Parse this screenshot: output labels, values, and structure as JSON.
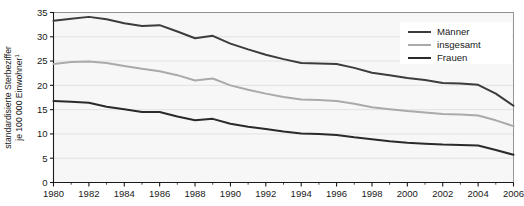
{
  "chart_data": {
    "type": "line",
    "title": "",
    "subtitle": "",
    "xlabel": "",
    "ylabel": "standardisierte Sterbeziffer je 100 000 Einwohner",
    "ylabel_superscript": "1",
    "xlim": [
      1980,
      2006
    ],
    "ylim": [
      0,
      35
    ],
    "y_ticks": [
      0,
      5,
      10,
      15,
      20,
      25,
      30,
      35
    ],
    "y_tick_labels": [
      "0",
      "5",
      "10",
      "15",
      "20",
      "25",
      "30",
      "35"
    ],
    "x_ticks": [
      1980,
      1982,
      1984,
      1986,
      1988,
      1990,
      1992,
      1994,
      1996,
      1998,
      2000,
      2002,
      2004,
      2006
    ],
    "x_tick_labels": [
      "1980",
      "1982",
      "1984",
      "1986",
      "1988",
      "1990",
      "1992",
      "1994",
      "1996",
      "1998",
      "2000",
      "2002",
      "2004",
      "2006"
    ],
    "x_minor_ticks": [
      1981,
      1983,
      1985,
      1987,
      1989,
      1991,
      1993,
      1995,
      1997,
      1999,
      2001,
      2003,
      2005
    ],
    "grid": "horizontal",
    "legend_position": "top-right",
    "x": [
      1980,
      1981,
      1982,
      1983,
      1984,
      1985,
      1986,
      1987,
      1988,
      1989,
      1990,
      1991,
      1992,
      1993,
      1994,
      1995,
      1996,
      1997,
      1998,
      1999,
      2000,
      2001,
      2002,
      2003,
      2004,
      2005,
      2006
    ],
    "series": [
      {
        "name": "Männer",
        "color": "#3c3c3c",
        "width": 2.0,
        "values": [
          33.3,
          33.7,
          34.1,
          33.6,
          32.8,
          32.2,
          32.4,
          31.1,
          29.7,
          30.2,
          28.6,
          27.4,
          26.3,
          25.4,
          24.6,
          24.5,
          24.4,
          23.6,
          22.6,
          22.1,
          21.5,
          21.1,
          20.5,
          20.4,
          20.1,
          18.3,
          15.8
        ]
      },
      {
        "name": "insgesamt",
        "color": "#aaaaaa",
        "width": 2.0,
        "values": [
          24.4,
          24.8,
          24.9,
          24.6,
          24.0,
          23.4,
          22.9,
          22.1,
          21.0,
          21.4,
          20.0,
          19.1,
          18.3,
          17.6,
          17.1,
          17.0,
          16.8,
          16.2,
          15.5,
          15.1,
          14.7,
          14.4,
          14.1,
          14.0,
          13.8,
          12.8,
          11.6
        ]
      },
      {
        "name": "Frauen",
        "color": "#2a2a2a",
        "width": 2.0,
        "values": [
          16.8,
          16.6,
          16.4,
          15.6,
          15.1,
          14.5,
          14.5,
          13.6,
          12.8,
          13.1,
          12.1,
          11.5,
          11.0,
          10.5,
          10.1,
          10.0,
          9.8,
          9.3,
          8.9,
          8.5,
          8.2,
          8.0,
          7.8,
          7.7,
          7.6,
          6.7,
          5.7
        ]
      }
    ]
  },
  "legend": {
    "items": [
      {
        "label": "Männer"
      },
      {
        "label": "insgesamt"
      },
      {
        "label": "Frauen"
      }
    ]
  },
  "colors": {
    "plot_background": "#f7f7f7",
    "grid": "#dcdcdc",
    "axis": "#1a1a1a",
    "page_background": "#ffffff",
    "maenner": "#3c3c3c",
    "insgesamt": "#aaaaaa",
    "frauen": "#2a2a2a"
  }
}
